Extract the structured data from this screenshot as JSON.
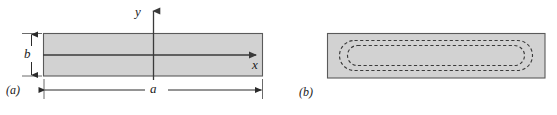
{
  "figure": {
    "caption_a": "(a)",
    "caption_b": "(b)",
    "axis_y_label": "y",
    "axis_x_label": "x",
    "dim_width_label": "a",
    "dim_height_label": "b",
    "colors": {
      "fill": "#d2d2d2",
      "stroke": "#555555",
      "line": "#3a3a3a",
      "dash": "#3a3a3a",
      "text": "#1a1a1a",
      "background": "#ffffff"
    },
    "panel_a": {
      "name": "rectangular-cross-section-with-axes",
      "rect": {
        "x": 43,
        "y": 33,
        "width": 220,
        "height": 43
      },
      "y_axis": {
        "x": 153,
        "y_top": 9,
        "y_bottom": 80
      },
      "x_axis": {
        "y": 55,
        "x_left": 43,
        "x_right": 262
      },
      "dim_a": {
        "y": 90,
        "x_left": 44,
        "x_right": 262
      },
      "dim_b": {
        "x": 31,
        "y_top": 33,
        "y_bottom": 76
      }
    },
    "panel_b": {
      "name": "rectangular-section-with-shear-flow-loops",
      "rect": {
        "x": 327,
        "y": 33,
        "width": 218,
        "height": 45
      },
      "loops": [
        {
          "x": 339,
          "y": 40,
          "width": 194,
          "height": 31,
          "radius": 15
        },
        {
          "x": 347,
          "y": 45,
          "width": 178,
          "height": 21,
          "radius": 10
        }
      ]
    }
  }
}
